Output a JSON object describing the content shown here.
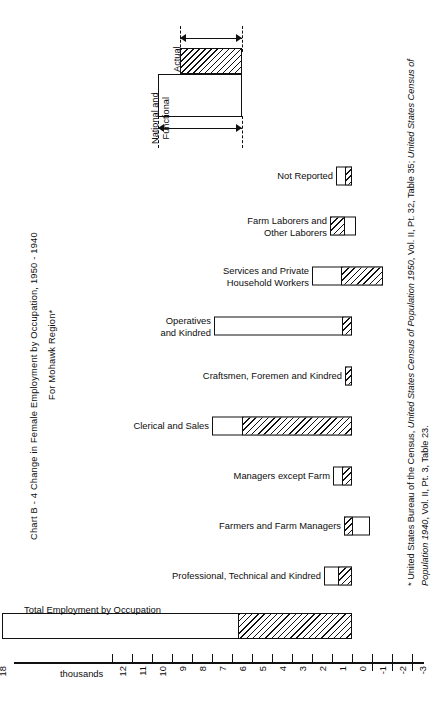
{
  "chart_title": "Chart B - 4   Change in Female Employment by Occupation, 1950 - 1940",
  "chart_subtitle": "For Mohawk Region*",
  "footnote": {
    "prefix": "* United States Bureau of the Census, ",
    "italic1": "United States Census of Population 1950",
    "mid": ", Vol. II, Pt. 32, Table 35; ",
    "italic2": "United States Census of Population 1940",
    "suffix": ", Vol. II, Pt. 3, Table 23."
  },
  "legend": {
    "actual_label": "Actual",
    "national_functional_label": "National and\nFunctional"
  },
  "axis": {
    "unit_label": "thousands",
    "tick_labels": [
      "20",
      "18",
      "12",
      "11",
      "10",
      "9",
      "8",
      "7",
      "6",
      "5",
      "4",
      "3",
      "2",
      "1",
      "0",
      "-1",
      "-2",
      "-3"
    ],
    "break_symbol": "≈"
  },
  "chart_data": {
    "type": "bar",
    "orientation": "horizontal",
    "title": "Chart B - 4   Change in Female Employment by Occupation, 1950 - 1940",
    "subtitle": "For Mohawk Region*",
    "xlabel": "thousands",
    "ylabel": "",
    "xlim": [
      -3,
      20
    ],
    "axis_break": {
      "between": [
        18,
        20
      ],
      "note": "scale break between 18 and 20 thousand"
    },
    "grid": false,
    "legend_position": "top-left",
    "categories": [
      "Not Reported",
      "Farm Laborers and\nOther Laborers",
      "Services and Private\nHousehold Workers",
      "Operatives\nand Kindred",
      "Craftsmen, Foremen and Kindred",
      "Clerical and Sales",
      "Managers except Farm",
      "Farmers and Farm Managers",
      "Professional, Technical and Kindred",
      "Total Employment by Occupation"
    ],
    "series": [
      {
        "name": "National and Functional",
        "note": "full bar extent (outer, unshaded)",
        "values": [
          0.8,
          1.1,
          2.0,
          6.9,
          0.35,
          7.0,
          0.95,
          -0.85,
          1.4,
          17.5
        ]
      },
      {
        "name": "Actual",
        "note": "hatched portion measured from the start of the National and Functional extent",
        "values": [
          0.35,
          0.75,
          1.5,
          0.45,
          0.3,
          5.5,
          0.45,
          -0.45,
          0.65,
          5.7
        ]
      }
    ],
    "bars": [
      {
        "category": "Not Reported",
        "nf_start": 0.8,
        "nf_end": 0.0,
        "hatch_start": 0.35,
        "hatch_end": 0.0
      },
      {
        "category": "Farm Laborers and Other Laborers",
        "nf_start": 1.1,
        "nf_end": -0.2,
        "hatch_start": 1.1,
        "hatch_end": 0.35
      },
      {
        "category": "Services and Private Household Workers",
        "nf_start": 2.0,
        "nf_end": -1.55,
        "hatch_start": 0.55,
        "hatch_end": -1.55
      },
      {
        "category": "Operatives and Kindred",
        "nf_start": 6.9,
        "nf_end": 0.0,
        "hatch_start": 0.5,
        "hatch_end": 0.0
      },
      {
        "category": "Craftsmen, Foremen and Kindred",
        "nf_start": 0.35,
        "nf_end": 0.0,
        "hatch_start": 0.35,
        "hatch_end": 0.0
      },
      {
        "category": "Clerical and Sales",
        "nf_start": 7.0,
        "nf_end": 0.0,
        "hatch_start": 5.5,
        "hatch_end": 0.0
      },
      {
        "category": "Managers except Farm",
        "nf_start": 0.95,
        "nf_end": 0.0,
        "hatch_start": 0.5,
        "hatch_end": 0.0
      },
      {
        "category": "Farmers and Farm Managers",
        "nf_start": 0.4,
        "nf_end": -0.9,
        "hatch_start": 0.4,
        "hatch_end": -0.05
      },
      {
        "category": "Professional, Technical and Kindred",
        "nf_start": 1.4,
        "nf_end": 0.0,
        "hatch_start": 0.7,
        "hatch_end": 0.0
      },
      {
        "category": "Total Employment by Occupation",
        "nf_start": 17.5,
        "nf_end": 0.0,
        "hatch_start": 5.7,
        "hatch_end": 0.0,
        "extra_segment": {
          "start": 20.3,
          "end": 19.6
        }
      }
    ]
  },
  "rows": [
    {
      "label": "Not Reported"
    },
    {
      "label": "Farm Laborers and\nOther Laborers"
    },
    {
      "label": "Services and Private\nHousehold Workers"
    },
    {
      "label": "Operatives\nand Kindred"
    },
    {
      "label": "Craftsmen, Foremen and Kindred"
    },
    {
      "label": "Clerical and Sales"
    },
    {
      "label": "Managers except Farm"
    },
    {
      "label": "Farmers and Farm Managers"
    },
    {
      "label": "Professional, Technical and Kindred"
    },
    {
      "label": "Total Employment by Occupation"
    }
  ]
}
